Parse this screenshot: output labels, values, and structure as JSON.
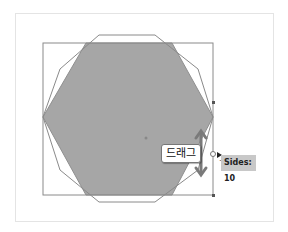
{
  "annotation": {
    "drag_label": "드래그"
  },
  "tooltip": {
    "text": "Sides: 10"
  },
  "colors": {
    "fill": "#a6a6a6",
    "stroke": "#888888",
    "arrow": "#7a7a7a"
  },
  "shapes": {
    "hexagon_sides": 6,
    "decagon_sides": 10
  }
}
